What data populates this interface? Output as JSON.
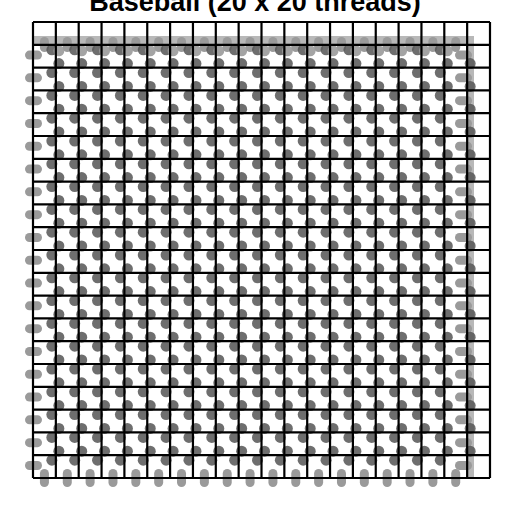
{
  "title": "Baseball (20 x 20 threads)",
  "grid": {
    "rows": 20,
    "cols": 20,
    "left": 33,
    "top": 22,
    "right": 490,
    "bottom": 478,
    "line_color": "#000000",
    "line_width": 2.2
  },
  "threads": {
    "band_color": "#b8b8b8",
    "capsule_color": "#9a9a9a",
    "dot_color": "#555555",
    "top_band": {
      "y": 36,
      "height": 8,
      "x_start": 33,
      "x_end": 473
    },
    "right_band": {
      "x": 467,
      "width": 7,
      "y_start": 36,
      "y_end": 478
    },
    "left_capsules": {
      "x": 25,
      "width": 17,
      "height": 9
    },
    "bottom_capsules": {
      "y": 469,
      "width": 9,
      "height": 18
    },
    "top_capsules": {
      "y": 37,
      "width": 9,
      "height": 15
    },
    "right_capsules": {
      "x": 455,
      "width": 17,
      "height": 9
    }
  }
}
